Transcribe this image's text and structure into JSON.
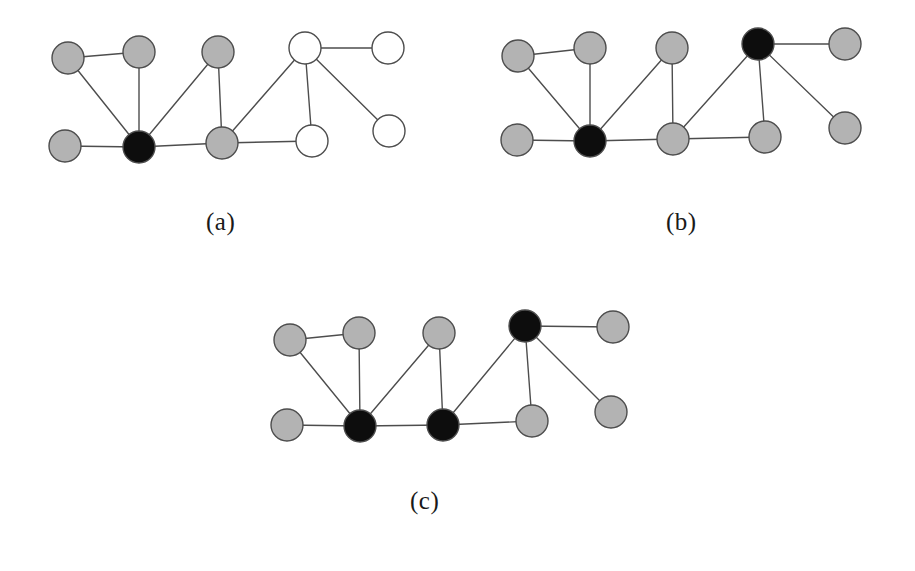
{
  "figure": {
    "title": "",
    "background_color": "#ffffff",
    "edge_color": "#4d4d4d",
    "edge_width": 1.4,
    "node_stroke_color": "#4d4d4d",
    "node_stroke_width": 1.4,
    "node_radius": 16,
    "colors": {
      "gray": "#b3b3b3",
      "black": "#0d0d0d",
      "white": "#ffffff"
    },
    "panels": [
      {
        "id": "a",
        "caption": "(a)",
        "caption_position": {
          "x": 206,
          "y": 208
        },
        "nodes": [
          {
            "id": "a1",
            "x": 68,
            "y": 58,
            "fill": "gray"
          },
          {
            "id": "a2",
            "x": 139,
            "y": 52,
            "fill": "gray"
          },
          {
            "id": "a3",
            "x": 218,
            "y": 52,
            "fill": "gray"
          },
          {
            "id": "a4",
            "x": 305,
            "y": 48,
            "fill": "white"
          },
          {
            "id": "a5",
            "x": 388,
            "y": 48,
            "fill": "white"
          },
          {
            "id": "a6",
            "x": 65,
            "y": 146,
            "fill": "gray"
          },
          {
            "id": "a7",
            "x": 139,
            "y": 147,
            "fill": "black"
          },
          {
            "id": "a8",
            "x": 222,
            "y": 143,
            "fill": "gray"
          },
          {
            "id": "a9",
            "x": 312,
            "y": 141,
            "fill": "white"
          },
          {
            "id": "a10",
            "x": 389,
            "y": 131,
            "fill": "white"
          }
        ],
        "edges": [
          [
            "a1",
            "a2"
          ],
          [
            "a1",
            "a7"
          ],
          [
            "a2",
            "a7"
          ],
          [
            "a3",
            "a7"
          ],
          [
            "a3",
            "a8"
          ],
          [
            "a6",
            "a7"
          ],
          [
            "a7",
            "a8"
          ],
          [
            "a4",
            "a5"
          ],
          [
            "a4",
            "a8"
          ],
          [
            "a4",
            "a9"
          ],
          [
            "a4",
            "a10"
          ],
          [
            "a8",
            "a9"
          ]
        ]
      },
      {
        "id": "b",
        "caption": "(b)",
        "caption_position": {
          "x": 666,
          "y": 208
        },
        "nodes": [
          {
            "id": "b1",
            "x": 518,
            "y": 56,
            "fill": "gray"
          },
          {
            "id": "b2",
            "x": 590,
            "y": 48,
            "fill": "gray"
          },
          {
            "id": "b3",
            "x": 672,
            "y": 48,
            "fill": "gray"
          },
          {
            "id": "b4",
            "x": 758,
            "y": 44,
            "fill": "black"
          },
          {
            "id": "b5",
            "x": 845,
            "y": 44,
            "fill": "gray"
          },
          {
            "id": "b6",
            "x": 517,
            "y": 140,
            "fill": "gray"
          },
          {
            "id": "b7",
            "x": 590,
            "y": 141,
            "fill": "black"
          },
          {
            "id": "b8",
            "x": 673,
            "y": 139,
            "fill": "gray"
          },
          {
            "id": "b9",
            "x": 765,
            "y": 137,
            "fill": "gray"
          },
          {
            "id": "b10",
            "x": 845,
            "y": 128,
            "fill": "gray"
          }
        ],
        "edges": [
          [
            "b1",
            "b2"
          ],
          [
            "b1",
            "b7"
          ],
          [
            "b2",
            "b7"
          ],
          [
            "b3",
            "b7"
          ],
          [
            "b3",
            "b8"
          ],
          [
            "b6",
            "b7"
          ],
          [
            "b7",
            "b8"
          ],
          [
            "b4",
            "b5"
          ],
          [
            "b4",
            "b8"
          ],
          [
            "b4",
            "b9"
          ],
          [
            "b4",
            "b10"
          ],
          [
            "b8",
            "b9"
          ]
        ]
      },
      {
        "id": "c",
        "caption": "(c)",
        "caption_position": {
          "x": 410,
          "y": 487
        },
        "nodes": [
          {
            "id": "c1",
            "x": 290,
            "y": 340,
            "fill": "gray"
          },
          {
            "id": "c2",
            "x": 359,
            "y": 333,
            "fill": "gray"
          },
          {
            "id": "c3",
            "x": 439,
            "y": 333,
            "fill": "gray"
          },
          {
            "id": "c4",
            "x": 525,
            "y": 326,
            "fill": "black"
          },
          {
            "id": "c5",
            "x": 613,
            "y": 327,
            "fill": "gray"
          },
          {
            "id": "c6",
            "x": 287,
            "y": 425,
            "fill": "gray"
          },
          {
            "id": "c7",
            "x": 360,
            "y": 426,
            "fill": "black"
          },
          {
            "id": "c8",
            "x": 443,
            "y": 425,
            "fill": "black"
          },
          {
            "id": "c9",
            "x": 532,
            "y": 421,
            "fill": "gray"
          },
          {
            "id": "c10",
            "x": 611,
            "y": 412,
            "fill": "gray"
          }
        ],
        "edges": [
          [
            "c1",
            "c2"
          ],
          [
            "c1",
            "c7"
          ],
          [
            "c2",
            "c7"
          ],
          [
            "c3",
            "c7"
          ],
          [
            "c3",
            "c8"
          ],
          [
            "c6",
            "c7"
          ],
          [
            "c7",
            "c8"
          ],
          [
            "c4",
            "c5"
          ],
          [
            "c4",
            "c8"
          ],
          [
            "c4",
            "c9"
          ],
          [
            "c4",
            "c10"
          ],
          [
            "c8",
            "c9"
          ]
        ]
      }
    ]
  }
}
